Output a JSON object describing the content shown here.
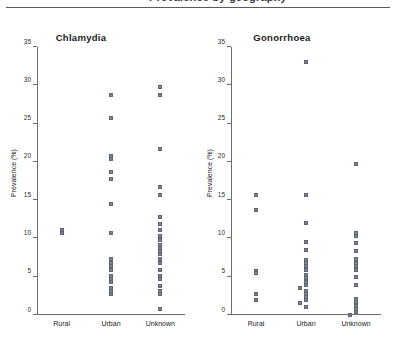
{
  "figure": {
    "cutoff_header": "Prevalence by geography",
    "ghost_note": ""
  },
  "chart_data": [
    {
      "type": "scatter",
      "title": "Chlamydia",
      "xlabel": "",
      "ylabel": "Prevalence (%)",
      "ylim": [
        0,
        35
      ],
      "yticks": [
        0,
        5,
        10,
        15,
        20,
        25,
        30,
        35
      ],
      "grid": false,
      "legend": "none",
      "categories": [
        "Rural",
        "Urban",
        "Unknown"
      ],
      "series": [
        {
          "name": "Rural",
          "values": [
            11,
            11.3
          ]
        },
        {
          "name": "Urban",
          "values": [
            29,
            26,
            21,
            20.6,
            19,
            18,
            14.7,
            11,
            7.6,
            7.1,
            6.6,
            6.2,
            5.4,
            5.0,
            4.6,
            3.8,
            3.4,
            3.0
          ]
        },
        {
          "name": "Unknown",
          "values": [
            30,
            29,
            22,
            17,
            16,
            13,
            12.2,
            11.4,
            10.6,
            10.0,
            9.4,
            9.0,
            8.6,
            8.2,
            7.6,
            7.0,
            6.2,
            5.4,
            5.0,
            4.0,
            3.4,
            3.0,
            1.0
          ]
        }
      ]
    },
    {
      "type": "scatter",
      "title": "Gonorrhoea",
      "xlabel": "",
      "ylabel": "Prevalence (%)",
      "ylim": [
        0,
        35
      ],
      "yticks": [
        0,
        5,
        10,
        15,
        20,
        25,
        30,
        35
      ],
      "grid": false,
      "legend": "none",
      "categories": [
        "Rural",
        "Urban",
        "Unknown"
      ],
      "series": [
        {
          "name": "Rural",
          "values": [
            16,
            14,
            6.0,
            5.7,
            3.0,
            2.2
          ]
        },
        {
          "name": "Urban",
          "values": [
            33.3,
            16,
            12.3,
            9.8,
            8.7,
            7.4,
            7.0,
            6.6,
            6.2,
            5.5,
            5.1,
            4.6,
            4.2,
            3.8,
            3.4,
            3.0,
            2.6,
            2.2,
            1.8,
            1.3
          ]
        },
        {
          "name": "Unknown",
          "values": [
            20,
            11,
            10.6,
            9.7,
            8.6,
            7.6,
            7.1,
            6.6,
            6.1,
            5.2,
            4.2,
            2.3,
            1.9,
            1.5,
            1.1,
            0.7,
            0.3
          ]
        }
      ]
    }
  ]
}
